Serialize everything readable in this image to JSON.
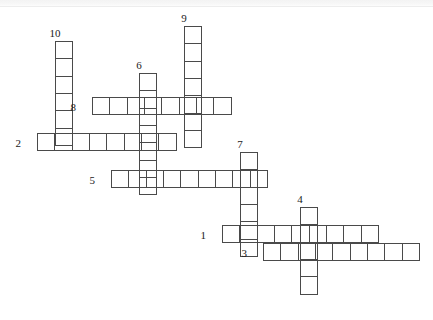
{
  "puzzle": {
    "title": "Crossword Puzzle Grid",
    "cell_size_px": 18.35,
    "background_color": "#ffffff",
    "cell_border_color": "#4a4a4a",
    "number_color": "#1a1a1a",
    "entry_count": 10,
    "entries": [
      {
        "number": "1",
        "direction": "across",
        "length": 9,
        "x": 222,
        "y": 225,
        "label_x": 206,
        "label_y": 230,
        "label_pos": "left"
      },
      {
        "number": "2",
        "direction": "across",
        "length": 8,
        "x": 37,
        "y": 133,
        "label_x": 21,
        "label_y": 138,
        "label_pos": "left"
      },
      {
        "number": "3",
        "direction": "across",
        "length": 9,
        "x": 263,
        "y": 243,
        "label_x": 247,
        "label_y": 248,
        "label_pos": "left"
      },
      {
        "number": "4",
        "direction": "down",
        "length": 5,
        "x": 300,
        "y": 207,
        "label_x": 300,
        "label_y": 194,
        "label_pos": "above"
      },
      {
        "number": "5",
        "direction": "across",
        "length": 9,
        "x": 111,
        "y": 170,
        "label_x": 95,
        "label_y": 175,
        "label_pos": "left"
      },
      {
        "number": "6",
        "direction": "down",
        "length": 7,
        "x": 139,
        "y": 73,
        "label_x": 139,
        "label_y": 60,
        "label_pos": "above"
      },
      {
        "number": "7",
        "direction": "down",
        "length": 6,
        "x": 240,
        "y": 152,
        "label_x": 240,
        "label_y": 139,
        "label_pos": "above"
      },
      {
        "number": "8",
        "direction": "across",
        "length": 8,
        "x": 92,
        "y": 97,
        "label_x": 76,
        "label_y": 102,
        "label_pos": "left"
      },
      {
        "number": "9",
        "direction": "down",
        "length": 7,
        "x": 184,
        "y": 26,
        "label_x": 184,
        "label_y": 13,
        "label_pos": "above"
      },
      {
        "number": "10",
        "direction": "down",
        "length": 6,
        "x": 55,
        "y": 41,
        "label_x": 55,
        "label_y": 28,
        "label_pos": "above"
      }
    ]
  }
}
